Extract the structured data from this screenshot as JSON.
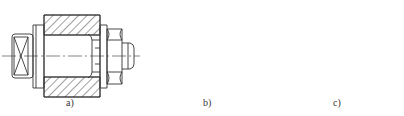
{
  "figure": {
    "type": "mechanical-section-drawing",
    "stroke_color": "#333333",
    "hatch_color": "#444444",
    "background": "#ffffff",
    "panels": [
      {
        "id": "a",
        "label": "a)",
        "description": "bushing with mandrel, collar and nut"
      },
      {
        "id": "b",
        "label": "b)",
        "description": "bushing with double-ended mandrel"
      },
      {
        "id": "c",
        "label": "c)",
        "description": "bushing with tapered mandrel"
      }
    ]
  }
}
